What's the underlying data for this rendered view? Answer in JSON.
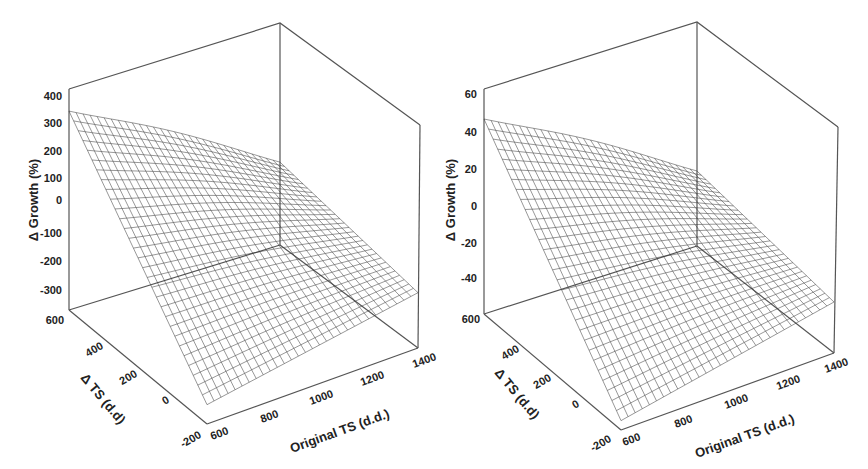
{
  "chart_data": [
    {
      "type": "surface3d",
      "panel": "left",
      "title": "",
      "xlabel": "Original TS (d.d.)",
      "ylabel": "Δ TS (d.d)",
      "zlabel": "Δ Growth (%)",
      "x_ticks": [
        "600",
        "800",
        "1000",
        "1200",
        "1400"
      ],
      "y_ticks": [
        "-200",
        "0",
        "200",
        "400",
        "600"
      ],
      "z_ticks": [
        "400",
        "300",
        "200",
        "100",
        "0",
        "-100",
        "-200",
        "-300"
      ],
      "xlim": [
        600,
        1400
      ],
      "ylim": [
        -200,
        600
      ],
      "zlim": [
        -400,
        400
      ],
      "surface_corners": [
        {
          "x": 600,
          "y": 600,
          "z": 320
        },
        {
          "x": 1400,
          "y": 600,
          "z": -100
        },
        {
          "x": 600,
          "y": -200,
          "z": -330
        },
        {
          "x": 1400,
          "y": -200,
          "z": -160
        }
      ],
      "grid": false
    },
    {
      "type": "surface3d",
      "panel": "right",
      "title": "",
      "xlabel": "Original TS (d.d.)",
      "ylabel": "Δ TS (d.d)",
      "zlabel": "Δ Growth (%)",
      "x_ticks": [
        "600",
        "800",
        "1000",
        "1200",
        "1400"
      ],
      "y_ticks": [
        "-200",
        "0",
        "200",
        "400",
        "600"
      ],
      "z_ticks": [
        "60",
        "40",
        "20",
        "0",
        "-20",
        "-40"
      ],
      "xlim": [
        600,
        1400
      ],
      "ylim": [
        -200,
        600
      ],
      "zlim": [
        -60,
        60
      ],
      "surface_corners": [
        {
          "x": 600,
          "y": 600,
          "z": 44
        },
        {
          "x": 1400,
          "y": 600,
          "z": -20
        },
        {
          "x": 600,
          "y": -200,
          "z": -55
        },
        {
          "x": 1400,
          "y": -200,
          "z": -28
        }
      ],
      "grid": false
    }
  ],
  "panels": {
    "left": {
      "zlabel": "Δ Growth (%)",
      "ylabel": "Δ TS (d.d)",
      "xlabel": "Original TS (d.d.)",
      "z_ticks": [
        "400",
        "300",
        "200",
        "100",
        "0",
        "-100",
        "-200",
        "-300"
      ],
      "y_ticks": [
        "600",
        "400",
        "200",
        "0",
        "-200"
      ],
      "x_ticks": [
        "600",
        "800",
        "1000",
        "1200",
        "1400"
      ]
    },
    "right": {
      "zlabel": "Δ Growth (%)",
      "ylabel": "Δ TS (d.d)",
      "xlabel": "Original TS (d.d.)",
      "z_ticks": [
        "60",
        "40",
        "20",
        "0",
        "-20",
        "-40"
      ],
      "y_ticks": [
        "600",
        "400",
        "200",
        "0",
        "-200"
      ],
      "x_ticks": [
        "600",
        "800",
        "1000",
        "1200",
        "1400"
      ]
    }
  }
}
